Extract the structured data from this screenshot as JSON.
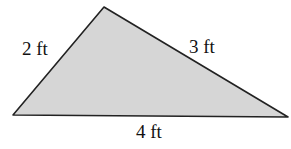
{
  "figure": {
    "shape": "triangle",
    "fill_color": "#d6d6d6",
    "stroke_color": "#222222",
    "vertices": [
      [
        104,
        7
      ],
      [
        13,
        115
      ],
      [
        288,
        117
      ]
    ],
    "sides": {
      "left": "2 ft",
      "right": "3 ft",
      "bottom": "4 ft"
    }
  }
}
